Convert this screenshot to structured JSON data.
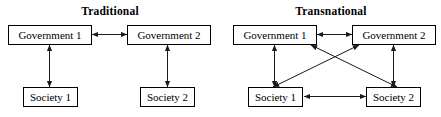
{
  "figure": {
    "type": "diagram",
    "subtype": "two-panel node-link diagram",
    "background_color": "#ffffff",
    "line_color": "#1a1a1a",
    "box_border_color": "#000000",
    "text_color": "#000000"
  },
  "panels": [
    {
      "id": "traditional",
      "title": "Traditional",
      "nodes": [
        {
          "id": "gov1",
          "label": "Government 1"
        },
        {
          "id": "gov2",
          "label": "Government 2"
        },
        {
          "id": "soc1",
          "label": "Society 1"
        },
        {
          "id": "soc2",
          "label": "Society 2"
        }
      ],
      "edges": [
        {
          "from": "gov1",
          "to": "gov2",
          "style": "double-headed-arrow",
          "orientation": "horizontal"
        },
        {
          "from": "gov1",
          "to": "soc1",
          "style": "double-headed-arrow",
          "orientation": "vertical"
        },
        {
          "from": "gov2",
          "to": "soc2",
          "style": "double-headed-arrow",
          "orientation": "vertical"
        }
      ]
    },
    {
      "id": "transnational",
      "title": "Transnational",
      "nodes": [
        {
          "id": "gov1",
          "label": "Government 1"
        },
        {
          "id": "gov2",
          "label": "Government 2"
        },
        {
          "id": "soc1",
          "label": "Society 1"
        },
        {
          "id": "soc2",
          "label": "Society 2"
        }
      ],
      "edges": [
        {
          "from": "gov1",
          "to": "gov2",
          "style": "double-headed-arrow",
          "orientation": "horizontal"
        },
        {
          "from": "soc1",
          "to": "soc2",
          "style": "double-headed-arrow",
          "orientation": "horizontal"
        },
        {
          "from": "gov1",
          "to": "soc1",
          "style": "double-headed-arrow",
          "orientation": "vertical"
        },
        {
          "from": "gov2",
          "to": "soc2",
          "style": "double-headed-arrow",
          "orientation": "vertical"
        },
        {
          "from": "gov1",
          "to": "soc2",
          "style": "double-headed-arrow",
          "orientation": "diagonal"
        },
        {
          "from": "gov2",
          "to": "soc1",
          "style": "double-headed-arrow",
          "orientation": "diagonal"
        }
      ]
    }
  ]
}
